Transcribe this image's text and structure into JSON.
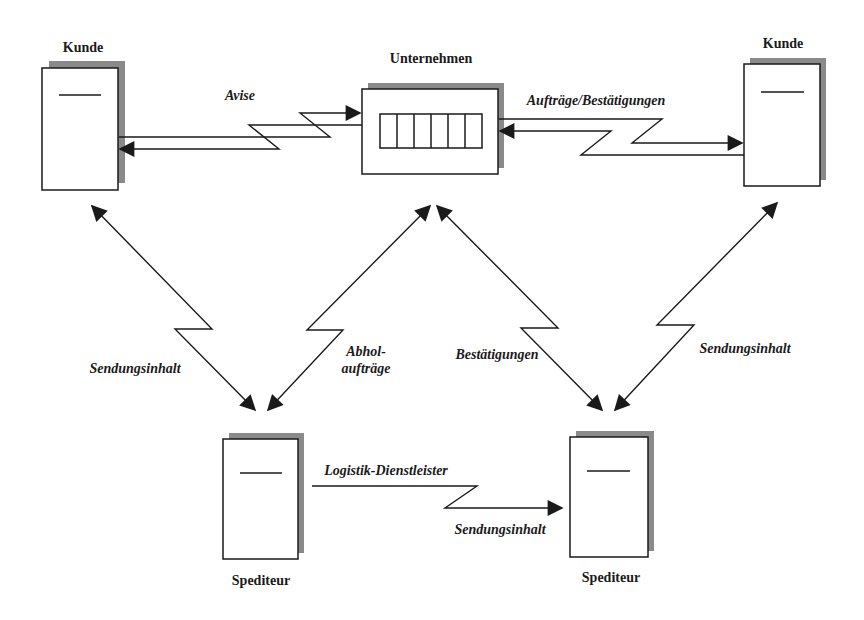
{
  "diagram": {
    "nodes": {
      "kunde_left": {
        "label": "Kunde"
      },
      "unternehmen": {
        "label": "Unternehmen",
        "cells": 6
      },
      "kunde_right": {
        "label": "Kunde"
      },
      "spediteur_left": {
        "label": "Spediteur"
      },
      "spediteur_right": {
        "label": "Spediteur"
      }
    },
    "edges": {
      "avise": {
        "label": "Avise",
        "from": "Kunde",
        "to": "Unternehmen",
        "direction": "bidirectional"
      },
      "auftraege": {
        "label": "Aufträge/Bestätigungen",
        "from": "Unternehmen",
        "to": "Kunde",
        "direction": "bidirectional"
      },
      "kunde_left_spediteur": {
        "label": "Sendungsinhalt",
        "direction": "bidirectional"
      },
      "abholauftraege": {
        "label_line1": "Abhol-",
        "label_line2": "aufträge",
        "direction": "bidirectional"
      },
      "bestaetigungen": {
        "label": "Bestätigungen",
        "direction": "bidirectional"
      },
      "kunde_right_spediteur": {
        "label": "Sendungsinhalt",
        "direction": "bidirectional"
      },
      "logistik": {
        "label_top": "Logistik-Dienstleister",
        "label_bottom": "Sendungsinhalt",
        "direction": "one-way"
      }
    }
  },
  "colors": {
    "stroke": "#1a1a1a",
    "shadow": "#8a8a8a",
    "background": "#ffffff"
  }
}
